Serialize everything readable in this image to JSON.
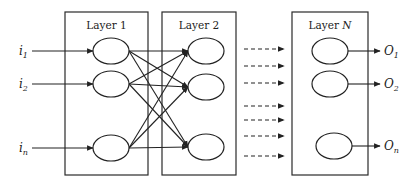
{
  "diagram": {
    "type": "neural-network-layers",
    "layers": [
      {
        "label": "Layer 1",
        "label_main": "Layer ",
        "label_var": "1",
        "box": [
          65,
          12,
          83,
          163
        ],
        "nodes": [
          [
            111,
            51
          ],
          [
            111,
            84
          ],
          [
            111,
            148
          ]
        ]
      },
      {
        "label": "Layer 2",
        "label_main": "Layer ",
        "label_var": "2",
        "box": [
          162,
          12,
          74,
          163
        ],
        "nodes": [
          [
            206,
            51
          ],
          [
            206,
            87
          ],
          [
            206,
            147
          ]
        ]
      },
      {
        "label": "Layer N",
        "label_main": "Layer ",
        "label_var": "N",
        "box": [
          292,
          12,
          76,
          163
        ],
        "nodes": [
          [
            330,
            51
          ],
          [
            330,
            84
          ],
          [
            334,
            146
          ]
        ]
      }
    ],
    "inputs": [
      {
        "base": "i",
        "sub": "1",
        "y": 51
      },
      {
        "base": "i",
        "sub": "2",
        "y": 84
      },
      {
        "base": "i",
        "sub": "n",
        "y": 148
      }
    ],
    "outputs": [
      {
        "base": "O",
        "sub": "1",
        "y": 51
      },
      {
        "base": "O",
        "sub": "2",
        "y": 84
      },
      {
        "base": "O",
        "sub": "n",
        "y": 146
      }
    ],
    "dashed_arrows_y": [
      49,
      66,
      83,
      106,
      120,
      136,
      156
    ],
    "colors": {
      "stroke": "#222222",
      "background": "#ffffff"
    }
  }
}
